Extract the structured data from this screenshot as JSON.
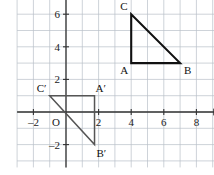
{
  "figure": {
    "background_color": "#ffffff",
    "grid": {
      "color": "#9aa3ae",
      "minor_color": "#b9c0c8",
      "show": true,
      "x_range": [
        -3,
        9.4
      ],
      "y_range": [
        -3.4,
        7.4
      ],
      "unit_px": 16.3
    },
    "axes": {
      "color": "#333333",
      "x_label": "x",
      "y_label": "y",
      "origin_label": "O",
      "x_ticks": [
        -2,
        2,
        4,
        6,
        8
      ],
      "x_tick_labels": [
        "–2",
        "2",
        "4",
        "6",
        "8"
      ],
      "y_ticks": [
        2,
        4,
        6
      ],
      "y_tick_labels": [
        "2",
        "4",
        "6"
      ],
      "negative_y_ticks": [
        -2
      ],
      "negative_y_tick_labels": [
        "–2"
      ]
    },
    "shapes": [
      {
        "name": "triangle-abc",
        "stroke": "#111111",
        "stroke_width": 2.1,
        "fill": "none",
        "vertices": [
          {
            "label": "C",
            "x": 4,
            "y": 6,
            "label_dx": -11,
            "label_dy": -4
          },
          {
            "label": "A",
            "x": 4,
            "y": 3,
            "label_dx": -11,
            "label_dy": 11
          },
          {
            "label": "B",
            "x": 7,
            "y": 3,
            "label_dx": 4,
            "label_dy": 11
          }
        ]
      },
      {
        "name": "triangle-a-prime-b-prime-c-prime",
        "stroke": "#555555",
        "stroke_width": 1.5,
        "fill": "none",
        "vertices": [
          {
            "label": "C′",
            "x": -1,
            "y": 1,
            "label_dx": -13,
            "label_dy": -4
          },
          {
            "label": "A′",
            "x": 1.75,
            "y": 1,
            "label_dx": 1,
            "label_dy": -4
          },
          {
            "label": "B′",
            "x": 1.75,
            "y": -2,
            "label_dx": 2,
            "label_dy": 12
          }
        ]
      }
    ]
  }
}
